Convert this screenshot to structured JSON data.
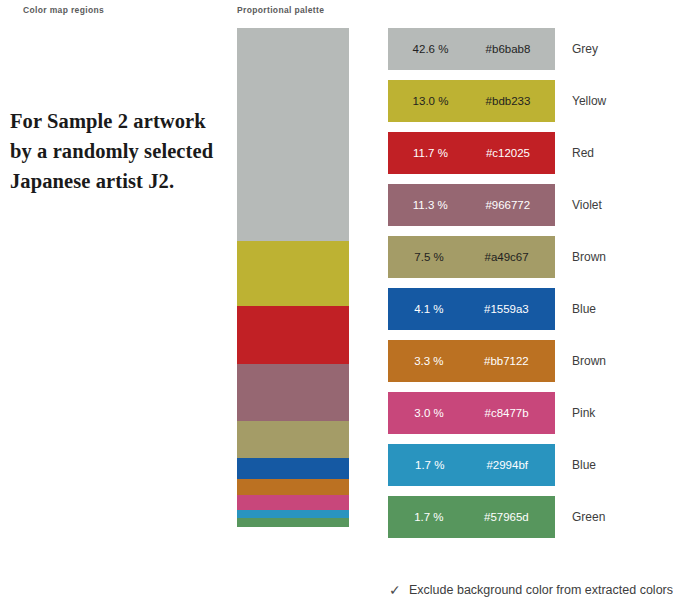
{
  "headers": {
    "regions": "Color map regions",
    "palette": "Proportional palette"
  },
  "caption": {
    "text": "For Sample 2 artwork by a randomly selected Japanese artist J2."
  },
  "footer": {
    "checkbox_icon": "✓",
    "checkbox_label": "Exclude background color from extracted colors",
    "checked": true
  },
  "chart_data": {
    "type": "bar",
    "title": "Proportional palette",
    "xlabel": "",
    "ylabel": "",
    "categories": [
      "Grey",
      "Yellow",
      "Red",
      "Violet",
      "Brown",
      "Blue",
      "Brown",
      "Pink",
      "Blue",
      "Green"
    ],
    "values": [
      42.6,
      13.0,
      11.7,
      11.3,
      7.5,
      4.1,
      3.3,
      3.0,
      1.7,
      1.7
    ],
    "colors": [
      "#b6bab8",
      "#bdb233",
      "#c12025",
      "#966772",
      "#a49c67",
      "#1559a3",
      "#bb7122",
      "#c8477b",
      "#2994bf",
      "#57965d"
    ],
    "unit": "%",
    "legend": "right"
  },
  "palette": {
    "rows": [
      {
        "pct": "42.6 %",
        "hex": "#b6bab8",
        "name": "Grey",
        "color": "#b6bab8",
        "text": "light",
        "share": 42.6
      },
      {
        "pct": "13.0 %",
        "hex": "#bdb233",
        "name": "Yellow",
        "color": "#bdb233",
        "text": "light",
        "share": 13.0
      },
      {
        "pct": "11.7 %",
        "hex": "#c12025",
        "name": "Red",
        "color": "#c12025",
        "text": "dark",
        "share": 11.7
      },
      {
        "pct": "11.3 %",
        "hex": "#966772",
        "name": "Violet",
        "color": "#966772",
        "text": "dark",
        "share": 11.3
      },
      {
        "pct": "7.5 %",
        "hex": "#a49c67",
        "name": "Brown",
        "color": "#a49c67",
        "text": "light",
        "share": 7.5
      },
      {
        "pct": "4.1 %",
        "hex": "#1559a3",
        "name": "Blue",
        "color": "#1559a3",
        "text": "dark",
        "share": 4.1
      },
      {
        "pct": "3.3 %",
        "hex": "#bb7122",
        "name": "Brown",
        "color": "#bb7122",
        "text": "dark",
        "share": 3.3
      },
      {
        "pct": "3.0 %",
        "hex": "#c8477b",
        "name": "Pink",
        "color": "#c8477b",
        "text": "dark",
        "share": 3.0
      },
      {
        "pct": "1.7 %",
        "hex": "#2994bf",
        "name": "Blue",
        "color": "#2994bf",
        "text": "dark",
        "share": 1.7
      },
      {
        "pct": "1.7 %",
        "hex": "#57965d",
        "name": "Green",
        "color": "#57965d",
        "text": "dark",
        "share": 1.7
      }
    ]
  }
}
